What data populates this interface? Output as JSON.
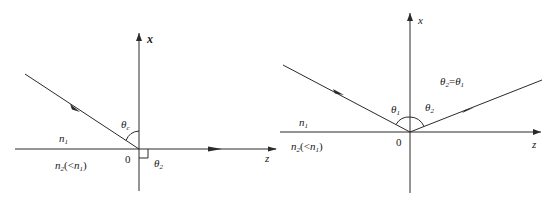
{
  "figures": [
    {
      "id": "total-internal-reflection-critical",
      "axes": {
        "vertical": "x",
        "horizontal": "z",
        "origin": "0"
      },
      "media": {
        "upper": "n",
        "upper_sub": "1",
        "lower": "n",
        "lower_sub": "2",
        "lower_note_open": "(<",
        "lower_note_n": "n",
        "lower_note_sub": "1",
        "lower_note_close": ")"
      },
      "angles": {
        "incident": "θ",
        "incident_sub": "c",
        "refracted": "θ",
        "refracted_sub": "2"
      }
    },
    {
      "id": "reflection",
      "axes": {
        "vertical": "x",
        "horizontal": "z",
        "origin": "0"
      },
      "media": {
        "upper": "n",
        "upper_sub": "1",
        "lower": "n",
        "lower_sub": "2",
        "lower_note_open": "(<",
        "lower_note_n": "n",
        "lower_note_sub": "1",
        "lower_note_close": ")"
      },
      "angles": {
        "incident": "θ",
        "incident_sub": "1",
        "reflected": "θ",
        "reflected_sub": "2"
      },
      "relation": {
        "lhs": "θ",
        "lhs_sub": "2",
        "eq": "=",
        "rhs": "θ",
        "rhs_sub": "1"
      }
    }
  ],
  "colors": {
    "line": "#2a2a2a",
    "text": "#1a1a1a",
    "background": "#ffffff"
  }
}
